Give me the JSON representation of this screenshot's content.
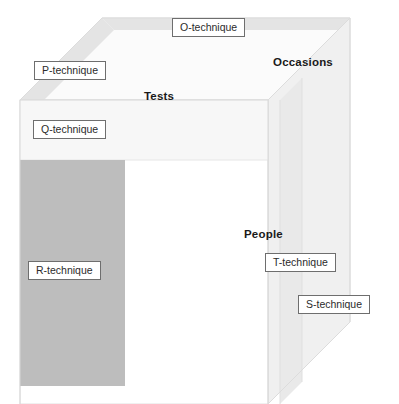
{
  "diagram": {
    "type": "cube-3d",
    "background_color": "#ffffff"
  },
  "axes": [
    {
      "id": "tests",
      "label": "Tests",
      "bold": true
    },
    {
      "id": "occasions",
      "label": "Occasions",
      "bold": true
    },
    {
      "id": "people",
      "label": "People",
      "bold": true
    }
  ],
  "techniques": [
    {
      "id": "o",
      "label": "O-technique"
    },
    {
      "id": "p",
      "label": "P-technique"
    },
    {
      "id": "q",
      "label": "Q-technique"
    },
    {
      "id": "r",
      "label": "R-technique"
    },
    {
      "id": "t",
      "label": "T-technique"
    },
    {
      "id": "s",
      "label": "S-technique"
    }
  ],
  "colors": {
    "front_face": "#ffffff",
    "front_top_band": "#f7f7f7",
    "highlight_slab": "#bdbdbd",
    "top_face": "#fbfbfb",
    "top_band": "#e4e4e4",
    "right_face": "#f0f0f0",
    "right_band": "#e8e8e8",
    "edge_line": "#d8d8d8",
    "box_border": "#6e6e6e",
    "text": "#2b2b2b",
    "axis_text": "#1a1a1a"
  }
}
